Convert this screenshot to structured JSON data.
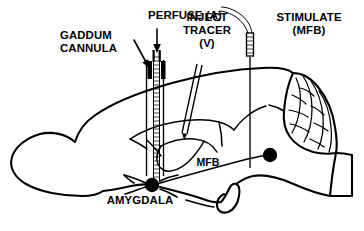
{
  "figure": {
    "background_color": "#ffffff",
    "ink_color": "#000000",
    "width": 364,
    "height": 231
  },
  "labels": {
    "perfuse": {
      "line1": "PERFUSE (A)",
      "x": 185,
      "y": 19
    },
    "gaddum_cannula": {
      "line1": "GADDUM",
      "line2": "CANNULA",
      "x": 60,
      "y": 39
    },
    "inject_tracer": {
      "line1": "INJECT",
      "line2": "TRACER",
      "line3": "(V)",
      "x": 207,
      "y": 21
    },
    "stimulate": {
      "line1": "STIMULATE",
      "line2": "(MFB)",
      "x": 309,
      "y": 21
    },
    "mfb": {
      "line1": "MFB",
      "x": 208,
      "y": 166
    },
    "amygdala": {
      "line1": "AMYGDALA",
      "x": 140,
      "y": 204
    }
  },
  "structures": [
    {
      "name": "olfactory-bulb",
      "label": ""
    },
    {
      "name": "cerebral-cortex",
      "label": ""
    },
    {
      "name": "cerebellum",
      "label": ""
    },
    {
      "name": "brainstem",
      "label": ""
    },
    {
      "name": "corpus-callosum",
      "label": ""
    },
    {
      "name": "hippocampus",
      "label": ""
    },
    {
      "name": "pituitary-loop",
      "label": ""
    }
  ],
  "markers": [
    {
      "name": "amygdala-nucleus",
      "label": "AMYGDALA",
      "cx": 152,
      "cy": 185,
      "r": 7.2
    },
    {
      "name": "mfb-target",
      "label": "MFB",
      "cx": 270,
      "cy": 155,
      "r": 7.2
    }
  ],
  "instruments": [
    {
      "name": "gaddum-cannula",
      "label": "GADDUM CANNULA",
      "orientation": "vertical"
    },
    {
      "name": "perfusion-inflow-arrow",
      "label": "PERFUSE (A)",
      "orientation": "vertical-down"
    },
    {
      "name": "tracer-injection-needle",
      "label": "INJECT TRACER (V)",
      "orientation": "oblique"
    },
    {
      "name": "stimulating-electrode",
      "label": "STIMULATE (MFB)",
      "orientation": "vertical"
    }
  ]
}
